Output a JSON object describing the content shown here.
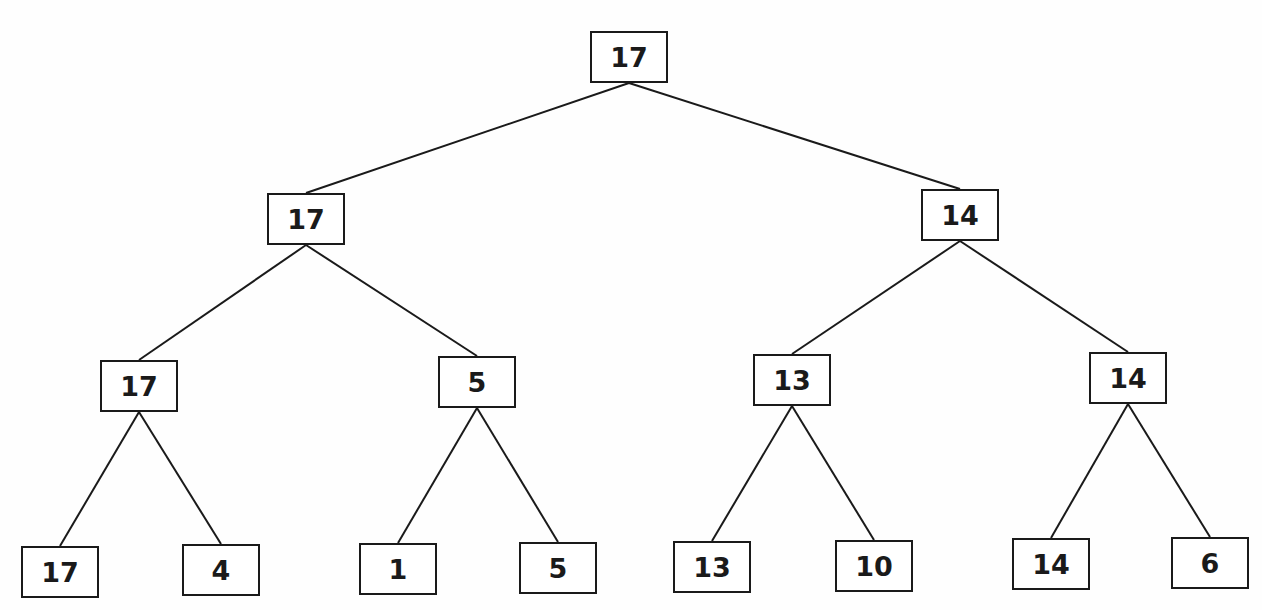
{
  "diagram": {
    "type": "binary-tree",
    "colors": {
      "line": "#1a1a1a",
      "background": "#ffffff"
    },
    "nodes": [
      {
        "id": "n0",
        "label": "17",
        "x": 590,
        "y": 31,
        "parent": null
      },
      {
        "id": "n1",
        "label": "17",
        "x": 267,
        "y": 193,
        "parent": "n0"
      },
      {
        "id": "n2",
        "label": "14",
        "x": 921,
        "y": 189,
        "parent": "n0"
      },
      {
        "id": "n3",
        "label": "17",
        "x": 100,
        "y": 360,
        "parent": "n1"
      },
      {
        "id": "n4",
        "label": "5",
        "x": 438,
        "y": 356,
        "parent": "n1"
      },
      {
        "id": "n5",
        "label": "13",
        "x": 753,
        "y": 354,
        "parent": "n2"
      },
      {
        "id": "n6",
        "label": "14",
        "x": 1089,
        "y": 352,
        "parent": "n2"
      },
      {
        "id": "n7",
        "label": "17",
        "x": 21,
        "y": 546,
        "parent": "n3"
      },
      {
        "id": "n8",
        "label": "4",
        "x": 182,
        "y": 544,
        "parent": "n3"
      },
      {
        "id": "n9",
        "label": "1",
        "x": 359,
        "y": 543,
        "parent": "n4"
      },
      {
        "id": "n10",
        "label": "5",
        "x": 519,
        "y": 542,
        "parent": "n4"
      },
      {
        "id": "n11",
        "label": "13",
        "x": 673,
        "y": 541,
        "parent": "n5"
      },
      {
        "id": "n12",
        "label": "10",
        "x": 835,
        "y": 540,
        "parent": "n5"
      },
      {
        "id": "n13",
        "label": "14",
        "x": 1012,
        "y": 538,
        "parent": "n6"
      },
      {
        "id": "n14",
        "label": "6",
        "x": 1171,
        "y": 537,
        "parent": "n6"
      }
    ]
  }
}
